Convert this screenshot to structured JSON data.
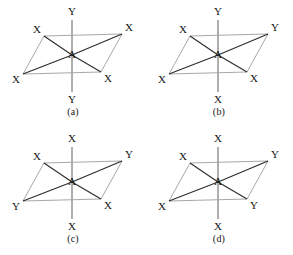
{
  "figure": {
    "center_atom": "A",
    "colors": {
      "plane_edge": "#a8a8a8",
      "axis_line": "#5e5e5e",
      "bond_line": "#2b2b2b",
      "label_text": "#141414",
      "background": "#ffffff"
    }
  },
  "panels": [
    {
      "id": "panel-a",
      "caption": "(a)",
      "center": "A",
      "labels": {
        "axial_top": "Y",
        "axial_bottom": "Y",
        "upper_left": "X",
        "upper_right": "X",
        "lower_left": "X",
        "lower_right": "X"
      }
    },
    {
      "id": "panel-b",
      "caption": "(b)",
      "center": "A",
      "labels": {
        "axial_top": "Y",
        "axial_bottom": "X",
        "upper_left": "X",
        "upper_right": "Y",
        "lower_left": "X",
        "lower_right": "X"
      }
    },
    {
      "id": "panel-c",
      "caption": "(c)",
      "center": "A",
      "labels": {
        "axial_top": "X",
        "axial_bottom": "X",
        "upper_left": "X",
        "upper_right": "Y",
        "lower_left": "Y",
        "lower_right": "X"
      }
    },
    {
      "id": "panel-d",
      "caption": "(d)",
      "center": "A",
      "labels": {
        "axial_top": "X",
        "axial_bottom": "X",
        "upper_left": "X",
        "upper_right": "Y",
        "lower_left": "X",
        "lower_right": "Y"
      }
    }
  ],
  "geometry": {
    "panel_size": [
      146,
      127
    ],
    "panel_origins": [
      [
        0,
        0
      ],
      [
        146,
        0
      ],
      [
        0,
        127
      ],
      [
        146,
        127
      ]
    ],
    "center_point": [
      72,
      55
    ],
    "plane_vertices": {
      "upper_left": [
        44,
        36
      ],
      "upper_right": [
        122,
        34
      ],
      "lower_left": [
        23,
        74
      ],
      "lower_right": [
        101,
        72
      ]
    },
    "axis_top_end": [
      72,
      20
    ],
    "axis_bottom_end": [
      72,
      92
    ],
    "label_offsets": {
      "axial_top": [
        72,
        12
      ],
      "axial_bottom": [
        72,
        100
      ],
      "upper_left": [
        37,
        30
      ],
      "upper_right": [
        129,
        28
      ],
      "lower_left": [
        16,
        80
      ],
      "lower_right": [
        108,
        79
      ]
    },
    "caption_y": 106
  }
}
